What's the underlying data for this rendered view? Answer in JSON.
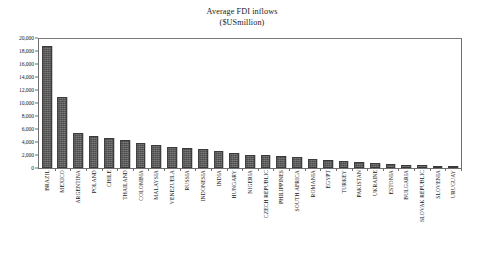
{
  "chart_data": {
    "type": "bar",
    "title": "Average FDI inflows",
    "subtitle": "($USmillion)",
    "xlabel": "",
    "ylabel": "",
    "ylim": [
      0,
      20000
    ],
    "grid": false,
    "legend": null,
    "y_ticks": [
      "0",
      "2,000",
      "4,000",
      "6,000",
      "8,000",
      "10,000",
      "12,000",
      "14,000",
      "16,000",
      "18,000",
      "20,000"
    ],
    "y_tick_values": [
      0,
      2000,
      4000,
      6000,
      8000,
      10000,
      12000,
      14000,
      16000,
      18000,
      20000
    ],
    "categories": [
      "BRAZIL",
      "MEXICO",
      "ARGENTINA",
      "POLAND",
      "CHILE",
      "THAILAND",
      "COLOMBIA",
      "MALAYSIA",
      "VENEZUELA",
      "RUSSIA",
      "INDONESIA",
      "INDIA",
      "HUNGARY",
      "NIGERIA",
      "CZECH REPUBLIC",
      "PHILIPPINES",
      "SOUTH AFRICA",
      "ROMANIA",
      "EGYPT",
      "TURKEY",
      "PAKISTAN",
      "UKRAINE",
      "ESTONIA",
      "BULGARIA",
      "SLOVAK REPUBLIC",
      "SLOVENIA",
      "URUGUAY"
    ],
    "values": [
      18800,
      10900,
      5400,
      4900,
      4600,
      4300,
      3800,
      3500,
      3300,
      3100,
      2950,
      2600,
      2300,
      2000,
      1950,
      1900,
      1700,
      1400,
      1250,
      1100,
      900,
      750,
      600,
      500,
      420,
      330,
      250
    ]
  }
}
